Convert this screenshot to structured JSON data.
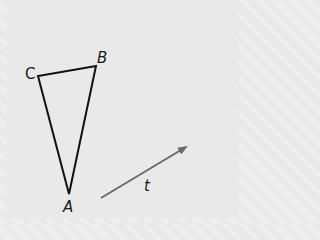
{
  "diagram": {
    "type": "geometry-translation",
    "colors": {
      "background": "#e9e9e9",
      "triangle_stroke": "#111111",
      "vector_stroke": "#6a6a6a",
      "label": "#1a1a1a"
    },
    "triangle": {
      "vertices": [
        {
          "name": "A",
          "label": "A",
          "x": 69,
          "y": 194
        },
        {
          "name": "B",
          "label": "B",
          "x": 96,
          "y": 66
        },
        {
          "name": "C",
          "label": "C",
          "x": 38,
          "y": 76
        }
      ]
    },
    "vector": {
      "label": "t",
      "from": {
        "x": 101,
        "y": 198
      },
      "to": {
        "x": 188,
        "y": 146
      }
    }
  }
}
